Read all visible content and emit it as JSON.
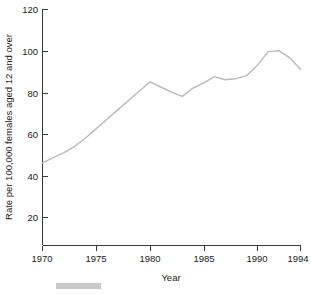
{
  "chart_data": {
    "type": "line",
    "title": "",
    "subtitle": "",
    "xlabel": "Year",
    "ylabel": "Rate per 100,000 females aged 12 and over",
    "xlim": [
      1970,
      1994
    ],
    "ylim": [
      0,
      120
    ],
    "grid": false,
    "legend": null,
    "x_ticks": [
      "1970",
      "1975",
      "1980",
      "1985",
      "1990",
      "1994"
    ],
    "x_tick_values": [
      1970,
      1975,
      1980,
      1985,
      1990,
      1994
    ],
    "y_ticks": [
      "20",
      "40",
      "60",
      "80",
      "100",
      "120"
    ],
    "y_tick_values": [
      20,
      40,
      60,
      80,
      100,
      120
    ],
    "line_color": "#b9b9b9",
    "axis_color": "#3a3a3a",
    "x": [
      1970,
      1971,
      1972,
      1973,
      1974,
      1975,
      1976,
      1977,
      1978,
      1979,
      1980,
      1981,
      1982,
      1983,
      1984,
      1985,
      1986,
      1987,
      1988,
      1989,
      1990,
      1991,
      1992,
      1993,
      1994
    ],
    "values": [
      46,
      48.5,
      51,
      54,
      58,
      62.5,
      67,
      71.5,
      76,
      80.5,
      85,
      82.5,
      80,
      78,
      82,
      84.5,
      87.5,
      86,
      86.5,
      88,
      93,
      99.5,
      100,
      96.5,
      91
    ],
    "series": [
      {
        "name": "Rate per 100,000 females aged 12 and over",
        "values": [
          46,
          48.5,
          51,
          54,
          58,
          62.5,
          67,
          71.5,
          76,
          80.5,
          85,
          82.5,
          80,
          78,
          82,
          84.5,
          87.5,
          86,
          86.5,
          88,
          93,
          99.5,
          100,
          96.5,
          91
        ]
      }
    ],
    "annotations": []
  },
  "axes": {
    "y_title": "Rate per 100,000 females aged 12 and over",
    "x_title": "Year"
  },
  "footer": {
    "bar_color": "#c9c9c9"
  }
}
